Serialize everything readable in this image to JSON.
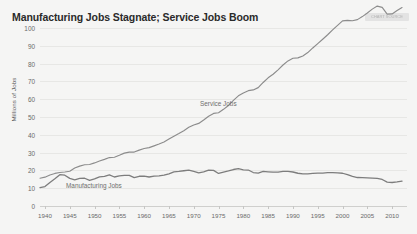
{
  "chart": {
    "title": "Manufacturing Jobs Stagnate; Service Jobs Boom",
    "badge_text": "CHART SOURCE",
    "ylabel": "Millions of Jobs",
    "yticks": [
      "100",
      "90",
      "80",
      "70",
      "60",
      "50",
      "40",
      "30",
      "20",
      "10",
      "0"
    ],
    "xticks": [
      "1940",
      "1945",
      "1950",
      "1955",
      "1960",
      "1965",
      "1970",
      "1975",
      "1980",
      "1985",
      "1990",
      "1995",
      "2000",
      "2005",
      "2010"
    ],
    "label_service": "Service Jobs",
    "label_manufacturing": "Manufacturing Jobs",
    "color_line": "#8c8c8c",
    "color_line_manufacturing": "#7d7d7d",
    "color_background": "#f5f5f4",
    "color_grid": "#e7e7e5"
  },
  "chart_data": {
    "type": "line",
    "title": "Manufacturing Jobs Stagnate; Service Jobs Boom",
    "xlabel": "",
    "ylabel": "Millions of Jobs",
    "xlim": [
      1939,
      2013
    ],
    "ylim": [
      0,
      100
    ],
    "grid": true,
    "legend": "inline-labels",
    "xticks": [
      1940,
      1945,
      1950,
      1955,
      1960,
      1965,
      1970,
      1975,
      1980,
      1985,
      1990,
      1995,
      2000,
      2005,
      2010
    ],
    "yticks": [
      0,
      10,
      20,
      30,
      40,
      50,
      60,
      70,
      80,
      90,
      100
    ],
    "x": [
      1939,
      1940,
      1941,
      1942,
      1943,
      1944,
      1945,
      1946,
      1947,
      1948,
      1949,
      1950,
      1951,
      1952,
      1953,
      1954,
      1955,
      1956,
      1957,
      1958,
      1959,
      1960,
      1961,
      1962,
      1963,
      1964,
      1965,
      1966,
      1967,
      1968,
      1969,
      1970,
      1971,
      1972,
      1973,
      1974,
      1975,
      1976,
      1977,
      1978,
      1979,
      1980,
      1981,
      1982,
      1983,
      1984,
      1985,
      1986,
      1987,
      1988,
      1989,
      1990,
      1991,
      1992,
      1993,
      1994,
      1995,
      1996,
      1997,
      1998,
      1999,
      2000,
      2001,
      2002,
      2003,
      2004,
      2005,
      2006,
      2007,
      2008,
      2009,
      2010,
      2011,
      2012
    ],
    "series": [
      {
        "name": "Service Jobs",
        "values": [
          15.6,
          16.2,
          17.4,
          18.3,
          18.8,
          19.1,
          19.5,
          21.3,
          22.4,
          23.2,
          23.3,
          24.2,
          25.3,
          26.2,
          27.2,
          27.4,
          28.5,
          29.7,
          30.3,
          30.3,
          31.4,
          32.3,
          32.8,
          33.8,
          34.8,
          36.0,
          37.6,
          39.2,
          40.7,
          42.3,
          44.2,
          45.5,
          46.4,
          48.3,
          50.4,
          52.0,
          52.4,
          54.3,
          56.5,
          59.3,
          61.9,
          63.5,
          64.8,
          65.2,
          66.5,
          69.4,
          72.0,
          74.0,
          76.5,
          79.2,
          81.5,
          83.0,
          83.2,
          84.3,
          86.2,
          88.8,
          91.2,
          93.7,
          96.2,
          98.9,
          101.5,
          104.0,
          104.3,
          104.1,
          104.7,
          106.4,
          108.4,
          110.6,
          112.3,
          111.6,
          107.8,
          107.9,
          109.8,
          111.5
        ]
      },
      {
        "name": "Manufacturing Jobs",
        "values": [
          10.3,
          10.9,
          13.2,
          15.3,
          17.6,
          17.3,
          15.5,
          14.7,
          15.5,
          15.6,
          14.4,
          15.2,
          16.4,
          16.6,
          17.5,
          16.3,
          16.9,
          17.2,
          17.2,
          15.9,
          16.7,
          16.8,
          16.3,
          16.8,
          16.9,
          17.3,
          18.1,
          19.2,
          19.4,
          19.8,
          20.1,
          19.4,
          18.6,
          19.2,
          20.2,
          20.0,
          18.3,
          19.0,
          19.7,
          20.5,
          21.0,
          20.3,
          20.2,
          18.8,
          18.5,
          19.4,
          19.2,
          19.0,
          19.0,
          19.4,
          19.4,
          19.1,
          18.4,
          18.1,
          18.1,
          18.3,
          18.5,
          18.5,
          18.7,
          18.8,
          18.6,
          18.4,
          17.6,
          16.6,
          16.0,
          15.9,
          15.8,
          15.7,
          15.5,
          14.9,
          13.4,
          13.2,
          13.5,
          14.0
        ]
      }
    ]
  }
}
